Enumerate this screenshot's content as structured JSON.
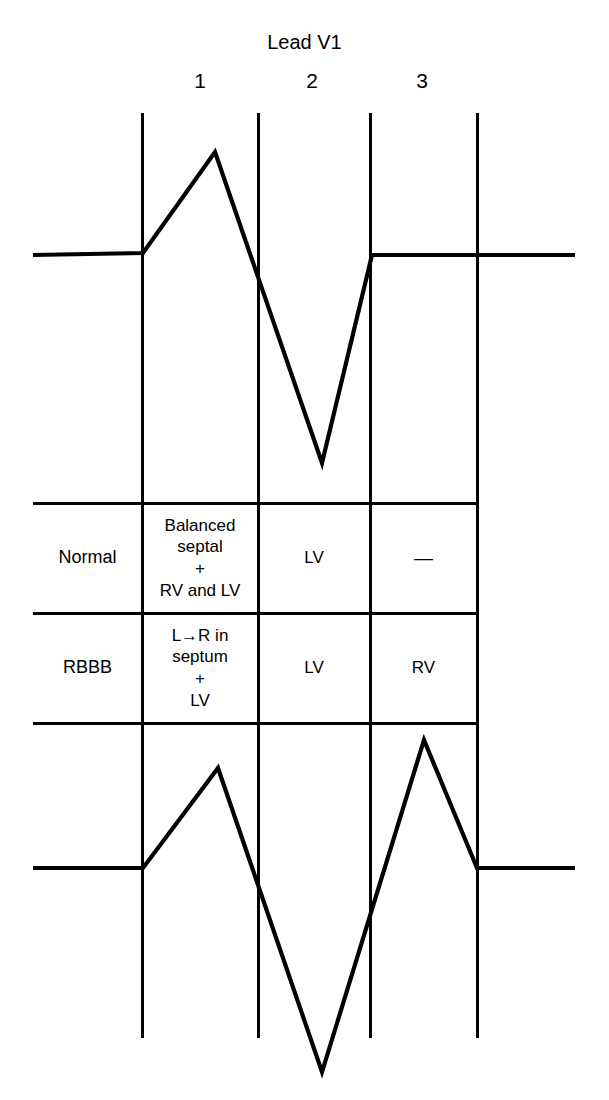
{
  "chart_data": {
    "type": "line",
    "title": "Lead V1",
    "subtitle": "",
    "xlabel": "",
    "ylabel": "",
    "grid": true,
    "legend_position": "none",
    "annotations": [
      "Normal",
      "RBBB"
    ],
    "column_phase_labels": [
      "1",
      "2",
      "3"
    ],
    "phase_boundaries_x": [
      142,
      258,
      370,
      477
    ],
    "series": [
      {
        "name": "Normal",
        "description": "Normal QRS complex in lead V1: small r wave then deep S wave (rS pattern)",
        "baseline_y": 255,
        "points": [
          {
            "x": 33,
            "y": 255
          },
          {
            "x": 143,
            "y": 253
          },
          {
            "x": 215,
            "y": 152
          },
          {
            "x": 322,
            "y": 463
          },
          {
            "x": 372,
            "y": 255
          },
          {
            "x": 575,
            "y": 255
          }
        ]
      },
      {
        "name": "RBBB",
        "description": "Right bundle branch block QRS complex in lead V1: rSR prime pattern with terminal tall R prime",
        "baseline_y": 868,
        "points": [
          {
            "x": 33,
            "y": 868
          },
          {
            "x": 143,
            "y": 868
          },
          {
            "x": 218,
            "y": 768
          },
          {
            "x": 322,
            "y": 1072
          },
          {
            "x": 424,
            "y": 740
          },
          {
            "x": 477,
            "y": 868
          },
          {
            "x": 575,
            "y": 868
          }
        ]
      }
    ],
    "table": {
      "row_header_label": "",
      "columns": [
        "1",
        "2",
        "3"
      ],
      "rows": [
        {
          "name": "Normal",
          "cells": [
            {
              "lines": [
                "Balanced",
                "septal",
                "+",
                "RV and LV"
              ]
            },
            {
              "lines": [
                "LV"
              ]
            },
            {
              "lines": [
                "—"
              ]
            }
          ]
        },
        {
          "name": "RBBB",
          "cells": [
            {
              "lines": [
                "L→R in",
                "septum",
                "+",
                "LV"
              ]
            },
            {
              "lines": [
                "LV"
              ]
            },
            {
              "lines": [
                "RV"
              ]
            }
          ]
        }
      ]
    },
    "colors": {
      "trace": "#000000",
      "grid_line": "#000000",
      "background": "#ffffff",
      "text": "#000000"
    }
  },
  "title": "Lead V1",
  "columns": {
    "c1": "1",
    "c2": "2",
    "c3": "3"
  },
  "table": {
    "normal": {
      "name": "Normal",
      "c1_l1": "Balanced",
      "c1_l2": "septal",
      "c1_l3": "+",
      "c1_l4": "RV and LV",
      "c2": "LV",
      "c3": "—"
    },
    "rbbb": {
      "name": "RBBB",
      "c1_l1": "L→R in",
      "c1_l2": "septum",
      "c1_l3": "+",
      "c1_l4": "LV",
      "c2": "LV",
      "c3": "RV"
    }
  }
}
